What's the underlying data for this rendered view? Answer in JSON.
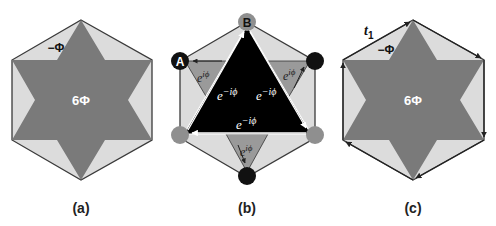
{
  "figure": {
    "colors": {
      "hex_fill": "#dcdcdc",
      "star_fill": "#7a7a7a",
      "outline": "#3a3a3a",
      "triangle_fill": "#000000",
      "small_triangle_fill": "#9a9a9a",
      "site_gray": "#8f8f8f",
      "site_black": "#111111",
      "text_white": "#ffffff",
      "text_black": "#111111"
    },
    "panels": [
      {
        "caption": "(a)",
        "star_label": "6Φ",
        "corner_label": "−Φ"
      },
      {
        "caption": "(b)",
        "site_labels": {
          "a": "A",
          "b": "B"
        },
        "hop_big": "e",
        "hop_big_exp": "−iϕ",
        "hop_small": "e",
        "hop_small_exp": "iϕ"
      },
      {
        "caption": "(c)",
        "star_label": "6Φ",
        "corner_label": "−Φ",
        "hopping_label": "t",
        "hopping_sub": "1"
      }
    ]
  }
}
